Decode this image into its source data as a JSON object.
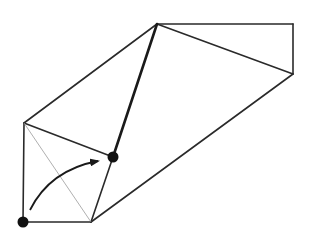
{
  "diagram": {
    "title": "",
    "stroke_color": "#2a2a2a",
    "dot_color": "#111111",
    "vertices": {
      "top": [
        157,
        24
      ],
      "top_right": [
        293,
        24
      ],
      "right": [
        293,
        74
      ],
      "left_top": [
        24,
        123
      ],
      "bottom_left": [
        23,
        222
      ],
      "bottom": [
        91,
        222
      ],
      "middle": [
        113,
        157
      ]
    },
    "edges": [
      {
        "from": "top",
        "to": "top_right",
        "style": "normal"
      },
      {
        "from": "top_right",
        "to": "right",
        "style": "normal"
      },
      {
        "from": "top",
        "to": "right",
        "style": "normal"
      },
      {
        "from": "right",
        "to": "bottom",
        "style": "normal"
      },
      {
        "from": "top",
        "to": "left_top",
        "style": "normal"
      },
      {
        "from": "top",
        "to": "middle",
        "style": "bold"
      },
      {
        "from": "left_top",
        "to": "middle",
        "style": "normal"
      },
      {
        "from": "middle",
        "to": "bottom",
        "style": "normal"
      },
      {
        "from": "left_top",
        "to": "bottom_left",
        "style": "normal"
      },
      {
        "from": "bottom_left",
        "to": "bottom",
        "style": "normal"
      },
      {
        "from": "left_top",
        "to": "bottom",
        "style": "thin"
      }
    ],
    "dots": [
      "bottom_left",
      "middle"
    ],
    "arrow": {
      "from": "bottom_left",
      "to": "middle",
      "description": "curved rotation arrow"
    }
  }
}
